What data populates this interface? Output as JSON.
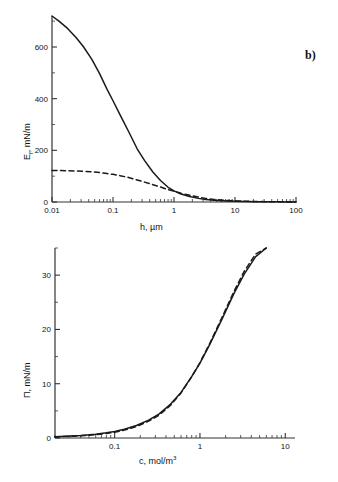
{
  "figure": {
    "background": "#ffffff",
    "line_color": "#1a1a1a",
    "axis_color": "#333333"
  },
  "panels": [
    {
      "id": "b",
      "label": "b)",
      "xlabel": "h, µm",
      "ylabel": "E",
      "ylabel_sub": "f",
      "ylabel_unit": ", mN/m"
    },
    {
      "id": "c",
      "label": "c)",
      "xlabel": "c, mol/m",
      "xlabel_sup": "3",
      "ylabel": "Π, mN/m"
    }
  ],
  "chart_data": [
    {
      "type": "line",
      "panel": "b)",
      "title": "",
      "xlabel": "h, µm",
      "ylabel": "E_f, mN/m",
      "xscale": "log",
      "yscale": "linear",
      "xlim": [
        0.01,
        100
      ],
      "ylim": [
        0,
        720
      ],
      "xticks": [
        0.01,
        0.1,
        1,
        10,
        100
      ],
      "xticklabels": [
        "0.01",
        "0.1",
        "1",
        "10",
        "100"
      ],
      "yticks": [
        0,
        200,
        400,
        600
      ],
      "yticklabels": [
        "0",
        "200",
        "400",
        "600"
      ],
      "yminorticks": [
        100,
        300,
        500,
        700
      ],
      "grid": false,
      "legend": "none",
      "series": [
        {
          "name": "solid",
          "style": "solid",
          "x": [
            0.01,
            0.013,
            0.018,
            0.025,
            0.033,
            0.045,
            0.06,
            0.08,
            0.1,
            0.13,
            0.18,
            0.25,
            0.33,
            0.45,
            0.6,
            0.8,
            1.0,
            1.3,
            1.8,
            2.5,
            3.3,
            4.5,
            6.0,
            8.0,
            10.0,
            15.0,
            22.0,
            33.0,
            50.0,
            70.0,
            100.0
          ],
          "y": [
            720,
            700,
            672,
            636,
            600,
            552,
            498,
            436,
            392,
            338,
            273,
            205,
            160,
            116,
            83,
            57,
            43,
            31,
            21,
            14,
            10,
            7,
            5,
            3.6,
            2.8,
            1.8,
            1.2,
            0.8,
            0.5,
            0.35,
            0.2
          ]
        },
        {
          "name": "dashed",
          "style": "dashed",
          "x": [
            0.01,
            0.013,
            0.018,
            0.025,
            0.033,
            0.045,
            0.06,
            0.08,
            0.1,
            0.13,
            0.18,
            0.25,
            0.33,
            0.45,
            0.6,
            0.8,
            1.0,
            1.3,
            1.8,
            2.5,
            3.3,
            4.5,
            6.0,
            8.0,
            10.0,
            15.0,
            22.0,
            33.0,
            50.0,
            70.0,
            100.0
          ],
          "y": [
            122,
            122,
            121,
            120,
            119,
            117,
            114,
            110,
            107,
            102,
            95,
            85,
            77,
            67,
            58,
            48,
            42,
            34,
            26,
            19,
            14,
            10,
            7.4,
            5.4,
            4.2,
            2.7,
            1.8,
            1.2,
            0.8,
            0.5,
            0.3
          ]
        }
      ]
    },
    {
      "type": "line",
      "panel": "c)",
      "title": "",
      "xlabel": "c, mol/m3",
      "ylabel": "Π, mN/m",
      "xscale": "log",
      "yscale": "linear",
      "xlim": [
        0.02,
        13
      ],
      "ylim": [
        0,
        35
      ],
      "xticks": [
        0.1,
        1,
        10
      ],
      "xticklabels": [
        "0.1",
        "1",
        "10"
      ],
      "yticks": [
        0,
        10,
        20,
        30
      ],
      "yticklabels": [
        "0",
        "10",
        "20",
        "30"
      ],
      "yminorticks": [
        5,
        15,
        25,
        35
      ],
      "grid": false,
      "legend": "none",
      "series": [
        {
          "name": "solid",
          "style": "solid",
          "x": [
            0.02,
            0.03,
            0.04,
            0.06,
            0.08,
            0.1,
            0.13,
            0.18,
            0.25,
            0.33,
            0.45,
            0.6,
            0.8,
            1.0,
            1.3,
            1.8,
            2.5,
            3.3,
            4.5,
            6.0
          ],
          "y": [
            0.25,
            0.35,
            0.45,
            0.7,
            0.95,
            1.2,
            1.6,
            2.3,
            3.3,
            4.4,
            6.2,
            8.4,
            11.3,
            13.8,
            17.2,
            21.8,
            26.6,
            30.2,
            33.4,
            35.5
          ]
        },
        {
          "name": "dashed",
          "style": "dashed",
          "x": [
            0.02,
            0.03,
            0.04,
            0.06,
            0.08,
            0.1,
            0.13,
            0.18,
            0.25,
            0.33,
            0.45,
            0.6,
            0.8,
            1.0,
            1.3,
            1.8,
            2.5,
            3.3,
            4.5,
            6.0
          ],
          "y": [
            0.2,
            0.3,
            0.4,
            0.6,
            0.85,
            1.05,
            1.45,
            2.1,
            3.1,
            4.2,
            6.0,
            8.3,
            11.3,
            13.9,
            17.4,
            22.1,
            27.0,
            30.7,
            33.9,
            36.0
          ]
        }
      ]
    }
  ]
}
